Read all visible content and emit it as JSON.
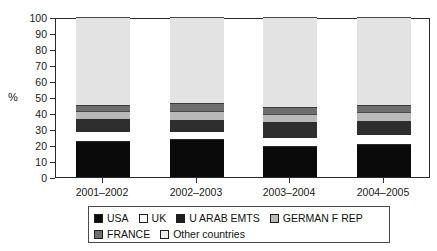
{
  "chart_data": {
    "type": "bar",
    "stacked": true,
    "stack_total": 100,
    "title": "",
    "subtitle": "",
    "xlabel": "",
    "ylabel": "%",
    "ylim": [
      0,
      100
    ],
    "yticks": [
      0,
      10,
      20,
      30,
      40,
      50,
      60,
      70,
      80,
      90,
      100
    ],
    "grid": false,
    "legend_position": "bottom",
    "categories": [
      "2001–2002",
      "2002–2003",
      "2003–2004",
      "2004–2005"
    ],
    "series": [
      {
        "name": "USA",
        "color": "#0a0a0a",
        "values": [
          22,
          23,
          19,
          20
        ]
      },
      {
        "name": "UK",
        "color": "#ffffff",
        "values": [
          7,
          6,
          6,
          7
        ]
      },
      {
        "name": "U ARAB EMTS",
        "color": "#2e2e2e",
        "values": [
          7,
          6.5,
          9.5,
          8
        ]
      },
      {
        "name": "GERMAN F REP",
        "color": "#b9b9b9",
        "values": [
          5,
          6,
          5,
          5.5
        ]
      },
      {
        "name": "FRANCE",
        "color": "#6e6e6e",
        "values": [
          4,
          4.5,
          4.5,
          4.5
        ]
      },
      {
        "name": "Other countries",
        "color": "#e3e3e3",
        "values": [
          55,
          54,
          56,
          55
        ]
      }
    ]
  },
  "axis": {
    "y_title": "%",
    "y_ticks": [
      "0",
      "10",
      "20",
      "30",
      "40",
      "50",
      "60",
      "70",
      "80",
      "90",
      "100"
    ],
    "x_labels": [
      "2001–2002",
      "2002–2003",
      "2003–2004",
      "2004–2005"
    ]
  },
  "legend": {
    "row1": [
      {
        "label": "USA",
        "swatch": "sw-usa"
      },
      {
        "label": "UK",
        "swatch": "sw-uk"
      },
      {
        "label": "U ARAB EMTS",
        "swatch": "sw-uae"
      },
      {
        "label": "GERMAN F REP",
        "swatch": "sw-ger"
      }
    ],
    "row2": [
      {
        "label": "FRANCE",
        "swatch": "sw-fra"
      },
      {
        "label": "Other countries",
        "swatch": "sw-oth"
      }
    ]
  }
}
